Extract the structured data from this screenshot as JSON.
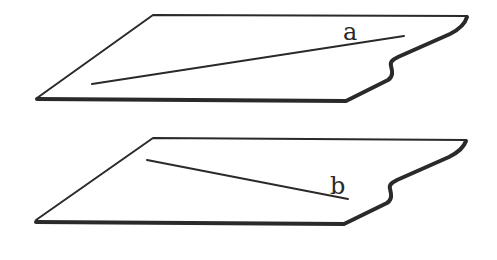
{
  "figure": {
    "sheets": [
      {
        "id": "top",
        "line_label": "a",
        "line": {
          "x1": 92,
          "y1": 84,
          "x2": 404,
          "y2": 36
        },
        "label_pos": {
          "x": 343,
          "y": 40
        }
      },
      {
        "id": "bottom",
        "line_label": "b",
        "line": {
          "x1": 147,
          "y1": 160,
          "x2": 348,
          "y2": 199
        },
        "label_pos": {
          "x": 330,
          "y": 194
        }
      }
    ],
    "colors": {
      "stroke": "#2a2a2a",
      "background": "#ffffff"
    }
  }
}
